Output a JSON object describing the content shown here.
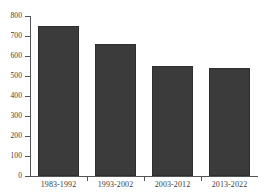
{
  "chart_data": {
    "type": "bar",
    "title": "",
    "subtitle": "",
    "xlabel": "",
    "ylabel": "",
    "categories": [
      "1983-1992",
      "1993-2002",
      "2003-2012",
      "2013-2022"
    ],
    "values": [
      750,
      660,
      550,
      540
    ],
    "series": [
      {
        "name": "",
        "values": [
          750,
          660,
          550,
          540
        ]
      }
    ],
    "ylim": [
      0,
      800
    ],
    "yticks": [
      0,
      100,
      200,
      300,
      400,
      500,
      600,
      700,
      800
    ],
    "ytick_labels": [
      "0",
      "100",
      "200",
      "300",
      "400",
      "500",
      "600",
      "700",
      "800"
    ],
    "grid": false,
    "legend": null,
    "legend_position": "none",
    "bar_color": "#3b3b3b",
    "axis_color": "#555555",
    "text_color": "#3c3c3c",
    "background_color": "#ffffff"
  }
}
